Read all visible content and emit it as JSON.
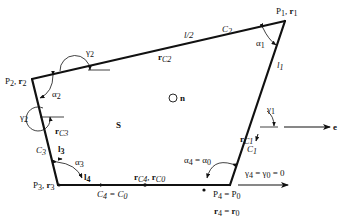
{
  "diagram": {
    "title": "",
    "colors": {
      "stroke": "#111111",
      "background": "#ffffff"
    },
    "vertices": {
      "p1": {
        "label": "P",
        "sub": "1",
        "vec": "r",
        "vsub": "1"
      },
      "p2": {
        "label": "P",
        "sub": "2",
        "vec": "r",
        "vsub": "2"
      },
      "p3": {
        "label": "P",
        "sub": "3",
        "vec": "r",
        "vsub": "3"
      },
      "p4": {
        "label": "P",
        "sub": "4",
        "eq": " = ",
        "label0": "P",
        "sub0": "0"
      }
    },
    "r4_eq": {
      "vec": "r",
      "sub": "4",
      "eq": " = ",
      "vec0": "r",
      "sub0": "0"
    },
    "edges": {
      "c1": {
        "label": "C",
        "sub": "1"
      },
      "c2": {
        "label": "C",
        "sub": "2"
      },
      "c3": {
        "label": "C",
        "sub": "3"
      },
      "c4": {
        "label": "C",
        "sub": "4",
        "eq": " = ",
        "label0": "C",
        "sub0": "0"
      }
    },
    "lengths": {
      "half_l": "l/2",
      "l1": {
        "label": "l",
        "sub": "1"
      },
      "l3": {
        "label": "l",
        "sub": "3"
      },
      "l4": {
        "label": "l",
        "sub": "4"
      }
    },
    "centers": {
      "rc1": {
        "vec": "r",
        "sub": "C1"
      },
      "rc2": {
        "vec": "r",
        "sub": "C2"
      },
      "rc3": {
        "vec": "r",
        "sub": "C3"
      },
      "rc4": {
        "vec": "r",
        "sub": "C4",
        "sep": ", ",
        "vec0": "r",
        "sub0": "C0"
      }
    },
    "angles": {
      "alpha1": {
        "sym": "α",
        "sub": "1"
      },
      "alpha2": {
        "sym": "α",
        "sub": "2"
      },
      "alpha3": {
        "sym": "α",
        "sub": "3"
      },
      "alpha4": {
        "sym": "α",
        "sub": "4",
        "eq": " = ",
        "sym0": "α",
        "sub0": "0"
      },
      "gamma1": {
        "sym": "γ",
        "sub": "1"
      },
      "gamma2_top": {
        "sym": "γ",
        "sub": "2"
      },
      "gamma2_side": {
        "sym": "γ",
        "sub": "2"
      },
      "gamma4": {
        "sym": "γ",
        "sub": "4",
        "eq": " = ",
        "sym0": "γ",
        "sub0": "0",
        "tail": " = 0"
      }
    },
    "normal": {
      "label": "n"
    },
    "direction": {
      "label": "e"
    },
    "region": {
      "label": "S"
    }
  }
}
